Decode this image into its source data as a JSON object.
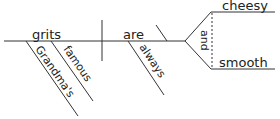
{
  "diagram": {
    "type": "sentence-diagram",
    "subject": "grits",
    "subject_modifiers": [
      "Grandma's",
      "famous"
    ],
    "verb": "are",
    "verb_modifiers": [
      "always"
    ],
    "conjunction": "and",
    "predicate_adjectives": [
      "cheesy",
      "smooth"
    ]
  }
}
